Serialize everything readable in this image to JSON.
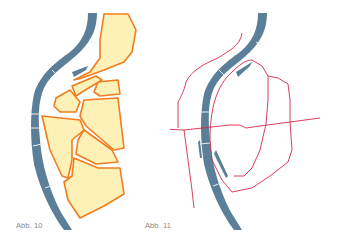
{
  "figures": [
    {
      "id": "fig10",
      "caption": "Abb. 10",
      "description": "River with adjacent city parcels outlined in orange"
    },
    {
      "id": "fig11",
      "caption": "Abb. 11",
      "description": "River with road network drawn as red lines"
    }
  ],
  "colors": {
    "background": "#ffffff",
    "river": "#5b7f98",
    "river_divider": "#e8eef2",
    "parcel_fill": "#fdf1b8",
    "parcel_stroke": "#f07d1e",
    "road": "#d22a4a",
    "caption": "#8a8a8a"
  }
}
